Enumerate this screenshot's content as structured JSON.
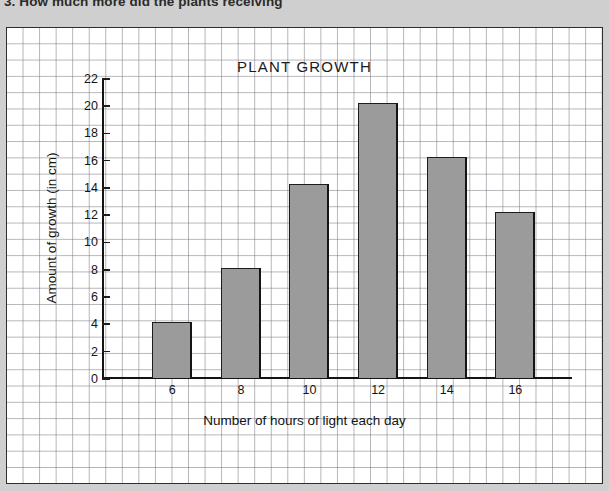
{
  "worksheet": {
    "question_text": "3.  How much more did the plants receiving"
  },
  "chart_data": {
    "type": "bar",
    "title": "PLANT GROWTH",
    "xlabel": "Number of hours of light each day",
    "ylabel": "Amount of growth (in cm)",
    "categories": [
      "6",
      "8",
      "10",
      "12",
      "14",
      "16"
    ],
    "values": [
      4.1,
      8.1,
      14.2,
      20.2,
      16.2,
      12.2
    ],
    "ylim": [
      0,
      22
    ],
    "ytick_step": 2,
    "yticks": [
      "0",
      "2",
      "4",
      "6",
      "8",
      "10",
      "12",
      "14",
      "16",
      "18",
      "20",
      "22"
    ],
    "grid": true,
    "legend": "none",
    "bar_color": "#9b9b9b",
    "bar_edge_color": "#1d1d1d",
    "axis_color": "#141414",
    "grid_color": "#787882",
    "plot_background": "#ffffff",
    "page_background": "#cfcfcf"
  }
}
